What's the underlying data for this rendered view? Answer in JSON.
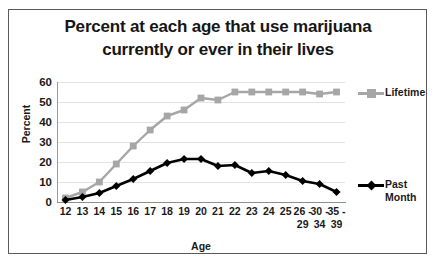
{
  "chart_data": {
    "type": "line",
    "title": "Percent at each age that use marijuana currently or ever in their lives",
    "title_lines": [
      "Percent at each age that use marijuana",
      "currently or ever in their lives"
    ],
    "xlabel": "Age",
    "ylabel": "Percent",
    "categories": [
      "12",
      "13",
      "14",
      "15",
      "16",
      "17",
      "18",
      "19",
      "20",
      "21",
      "22",
      "23",
      "24",
      "25",
      "26-29",
      "30-34",
      "35-39"
    ],
    "category_lines": [
      [
        "12"
      ],
      [
        "13"
      ],
      [
        "14"
      ],
      [
        "15"
      ],
      [
        "16"
      ],
      [
        "17"
      ],
      [
        "18"
      ],
      [
        "19"
      ],
      [
        "20"
      ],
      [
        "21"
      ],
      [
        "22"
      ],
      [
        "23"
      ],
      [
        "24"
      ],
      [
        "25"
      ],
      [
        "26 -",
        "29"
      ],
      [
        "30 -",
        "34"
      ],
      [
        "35 -",
        "39"
      ]
    ],
    "series": [
      {
        "name": "Lifetime",
        "color": "#a6a6a6",
        "marker": "square",
        "values": [
          2,
          5,
          10,
          19,
          28,
          36,
          43,
          46,
          52,
          51,
          55,
          55,
          55,
          55,
          55,
          54,
          55
        ]
      },
      {
        "name": "Past Month",
        "color": "#000000",
        "marker": "diamond",
        "values": [
          1,
          2.5,
          4.5,
          8,
          11.5,
          15.5,
          19.5,
          21.5,
          21.5,
          18,
          18.5,
          14.5,
          15.5,
          13.5,
          10.5,
          9,
          5
        ]
      }
    ],
    "ylim": [
      0,
      60
    ],
    "yticks": [
      "0",
      "10",
      "20",
      "30",
      "40",
      "50",
      "60"
    ],
    "grid": true,
    "legend_position": "right",
    "legend": [
      {
        "label": "Lifetime",
        "lines": [
          "Lifetime"
        ]
      },
      {
        "label": "Past Month",
        "lines": [
          "Past",
          "Month"
        ]
      }
    ]
  }
}
